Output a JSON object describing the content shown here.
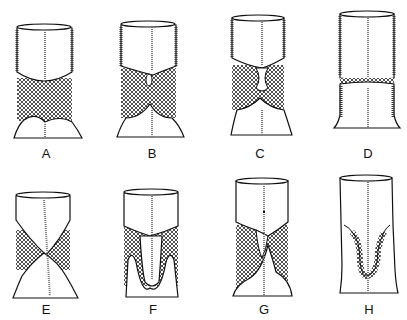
{
  "figure": {
    "panels": [
      {
        "id": "A",
        "label": "A",
        "label_x": 46,
        "label_y": 146
      },
      {
        "id": "B",
        "label": "B",
        "label_x": 152,
        "label_y": 146
      },
      {
        "id": "C",
        "label": "C",
        "label_x": 260,
        "label_y": 146
      },
      {
        "id": "D",
        "label": "D",
        "label_x": 368,
        "label_y": 146
      },
      {
        "id": "E",
        "label": "E",
        "label_x": 46,
        "label_y": 302
      },
      {
        "id": "F",
        "label": "F",
        "label_x": 153,
        "label_y": 302
      },
      {
        "id": "G",
        "label": "G",
        "label_x": 264,
        "label_y": 302
      },
      {
        "id": "H",
        "label": "H",
        "label_x": 369,
        "label_y": 302
      }
    ],
    "colors": {
      "ink": "#111111",
      "background": "#ffffff"
    }
  }
}
